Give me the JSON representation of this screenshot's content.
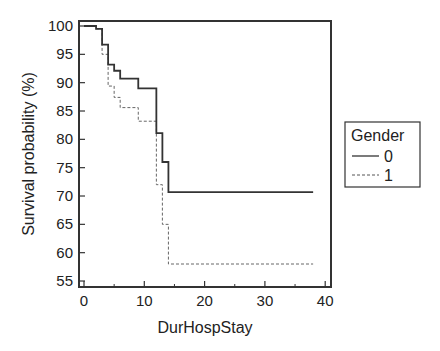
{
  "chart_data": {
    "type": "line",
    "subtype": "kaplan-meier step",
    "title": "",
    "xlabel": "DurHospStay",
    "ylabel": "Survival probability (%)",
    "xlim": [
      -1,
      40.5
    ],
    "ylim": [
      54,
      101
    ],
    "x_ticks": [
      0,
      10,
      20,
      30,
      40
    ],
    "x_minor_ticks": [
      5,
      15,
      25,
      35
    ],
    "y_ticks": [
      55,
      60,
      65,
      70,
      75,
      80,
      85,
      90,
      95,
      100
    ],
    "grid": false,
    "legend": {
      "title": "Gender",
      "position": "right",
      "entries": [
        {
          "label": "0",
          "style": "solid"
        },
        {
          "label": "1",
          "style": "dashed"
        }
      ]
    },
    "series": [
      {
        "name": "0",
        "style": "solid",
        "x": [
          0,
          2,
          3,
          4,
          5,
          6,
          9,
          12,
          13,
          14,
          38
        ],
        "y": [
          100,
          99.5,
          96.7,
          93.2,
          92.1,
          90.7,
          89.0,
          81.1,
          76.0,
          70.7,
          70.7
        ]
      },
      {
        "name": "1",
        "style": "dashed",
        "x": [
          0,
          2,
          3,
          4,
          5,
          6,
          9,
          12,
          13,
          14,
          38
        ],
        "y": [
          100,
          99.5,
          95.0,
          89.4,
          87.4,
          85.6,
          83.2,
          72.0,
          65.0,
          58.0,
          58.0
        ]
      }
    ]
  },
  "axes": {
    "xlabel": "DurHospStay",
    "ylabel": "Survival probability (%)",
    "x_tick_labels": [
      "0",
      "10",
      "20",
      "30",
      "40"
    ],
    "y_tick_labels": [
      "55",
      "60",
      "65",
      "70",
      "75",
      "80",
      "85",
      "90",
      "95",
      "100"
    ]
  },
  "legend": {
    "title": "Gender",
    "items": [
      {
        "label": "0"
      },
      {
        "label": "1"
      }
    ]
  },
  "colors": {
    "line": "#333333",
    "dashed_line": "#666666",
    "frame": "#333333"
  }
}
